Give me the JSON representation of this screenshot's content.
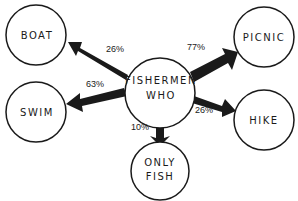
{
  "diagram": {
    "center": {
      "line1": "FISHERMEN",
      "line2": "WHO"
    },
    "nodes": {
      "boat": {
        "label": "BOAT",
        "percent": "26%"
      },
      "swim": {
        "label": "SWIM",
        "percent": "63%"
      },
      "picnic": {
        "label": "PICNIC",
        "percent": "77%"
      },
      "hike": {
        "label": "HIKE",
        "percent": "26%"
      },
      "only_fish": {
        "line1": "ONLY",
        "line2": "FISH",
        "percent": "10%"
      }
    },
    "colors": {
      "stroke": "#1a1a1a",
      "background": "#ffffff"
    }
  }
}
